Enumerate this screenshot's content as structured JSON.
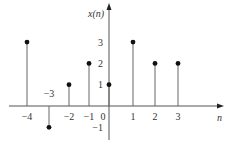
{
  "chart_data": {
    "type": "stem",
    "title": "",
    "xlabel": "n",
    "ylabel": "x(n)",
    "x": [
      -4,
      -3,
      -2,
      -1,
      0,
      1,
      2,
      3
    ],
    "values": [
      3,
      -1,
      1,
      2,
      1,
      3,
      2,
      2
    ],
    "x_tick_labels": [
      "-4",
      "-3",
      "-2",
      "-1",
      "0",
      "1",
      "2",
      "3"
    ],
    "y_tick_labels": [
      "3",
      "2",
      "1",
      "-1"
    ],
    "y_ticks": [
      3,
      2,
      1,
      -1
    ],
    "xlim": [
      -4.5,
      5
    ],
    "ylim": [
      -1.5,
      4.5
    ],
    "grid": false,
    "legend": null
  },
  "colors": {
    "axis": "#555555",
    "stem": "#666666",
    "marker": "#111111",
    "text": "#333333"
  }
}
